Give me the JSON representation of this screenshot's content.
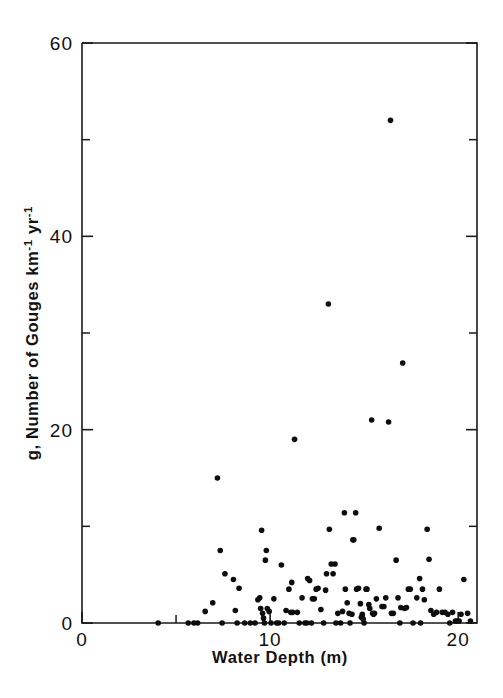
{
  "figure": {
    "background_color": "#ffffff",
    "ink_color": "#111111",
    "point_color": "#0d0d0d"
  },
  "chart_data": {
    "type": "scatter",
    "title": "",
    "xlabel": "Water Depth (m)",
    "ylabel": "g, Number of Gouges km-1 yr-1",
    "ylabel_parts": {
      "prefix": "g, Number of Gouges km",
      "sup1": "-1",
      "mid": " yr",
      "sup2": "-1"
    },
    "xlim": [
      0,
      21
    ],
    "ylim": [
      0,
      60
    ],
    "xticks": [
      0,
      10,
      20
    ],
    "xticklabels": [
      "0",
      "10",
      "20"
    ],
    "xticks_minor": [
      5,
      15
    ],
    "yticks": [
      0,
      20,
      40,
      60
    ],
    "yticklabels": [
      "0",
      "20",
      "40",
      "60"
    ],
    "yticks_minor": [
      10,
      30,
      50
    ],
    "grid": false,
    "legend": null,
    "marker": "filled-circle",
    "marker_size_px": 4,
    "n_points": 131,
    "points": [
      [
        4.05,
        0.0
      ],
      [
        5.65,
        0.0
      ],
      [
        5.95,
        0.0
      ],
      [
        6.15,
        0.0
      ],
      [
        6.55,
        1.2
      ],
      [
        6.95,
        2.1
      ],
      [
        7.2,
        15.0
      ],
      [
        7.35,
        7.5
      ],
      [
        7.45,
        0.0
      ],
      [
        7.6,
        5.1
      ],
      [
        8.05,
        4.5
      ],
      [
        8.15,
        1.3
      ],
      [
        8.25,
        0.0
      ],
      [
        8.35,
        3.6
      ],
      [
        8.65,
        0.0
      ],
      [
        8.95,
        0.0
      ],
      [
        9.2,
        0.0
      ],
      [
        9.35,
        2.4
      ],
      [
        9.45,
        2.6
      ],
      [
        9.5,
        1.5
      ],
      [
        9.55,
        9.6
      ],
      [
        9.6,
        1.0
      ],
      [
        9.65,
        0.5
      ],
      [
        9.7,
        0.0
      ],
      [
        9.75,
        6.5
      ],
      [
        9.8,
        7.5
      ],
      [
        9.85,
        1.5
      ],
      [
        9.95,
        1.2
      ],
      [
        10.05,
        0.0
      ],
      [
        10.2,
        2.5
      ],
      [
        10.35,
        0.0
      ],
      [
        10.6,
        6.0
      ],
      [
        10.75,
        0.0
      ],
      [
        10.85,
        1.3
      ],
      [
        11.0,
        3.5
      ],
      [
        11.1,
        1.1
      ],
      [
        11.15,
        4.2
      ],
      [
        11.2,
        1.1
      ],
      [
        11.3,
        19.0
      ],
      [
        11.45,
        1.1
      ],
      [
        11.55,
        0.0
      ],
      [
        11.7,
        2.6
      ],
      [
        11.85,
        0.0
      ],
      [
        12.0,
        4.6
      ],
      [
        12.1,
        4.4
      ],
      [
        12.25,
        2.5
      ],
      [
        12.35,
        2.5
      ],
      [
        12.45,
        3.5
      ],
      [
        12.55,
        3.6
      ],
      [
        12.7,
        1.4
      ],
      [
        12.85,
        0.0
      ],
      [
        12.95,
        3.4
      ],
      [
        13.0,
        5.1
      ],
      [
        13.1,
        33.0
      ],
      [
        13.15,
        9.7
      ],
      [
        13.25,
        6.1
      ],
      [
        13.35,
        5.1
      ],
      [
        13.45,
        6.1
      ],
      [
        13.6,
        1.0
      ],
      [
        13.75,
        0.0
      ],
      [
        13.85,
        1.2
      ],
      [
        13.95,
        11.4
      ],
      [
        14.0,
        3.5
      ],
      [
        14.1,
        2.1
      ],
      [
        14.2,
        1.0
      ],
      [
        14.35,
        0.9
      ],
      [
        14.4,
        8.6
      ],
      [
        14.45,
        8.6
      ],
      [
        14.55,
        11.4
      ],
      [
        14.6,
        3.5
      ],
      [
        14.7,
        3.6
      ],
      [
        14.8,
        2.0
      ],
      [
        14.85,
        0.6
      ],
      [
        14.9,
        0.9
      ],
      [
        14.95,
        0.4
      ],
      [
        15.0,
        0.0
      ],
      [
        15.1,
        3.5
      ],
      [
        15.15,
        3.5
      ],
      [
        15.25,
        1.9
      ],
      [
        15.3,
        1.5
      ],
      [
        15.4,
        21.0
      ],
      [
        15.45,
        1.0
      ],
      [
        15.5,
        0.9
      ],
      [
        15.55,
        1.0
      ],
      [
        15.65,
        2.5
      ],
      [
        15.8,
        9.8
      ],
      [
        15.95,
        1.7
      ],
      [
        16.05,
        1.7
      ],
      [
        16.15,
        2.6
      ],
      [
        16.3,
        20.8
      ],
      [
        16.4,
        52.0
      ],
      [
        16.45,
        1.0
      ],
      [
        16.55,
        1.0
      ],
      [
        16.7,
        6.5
      ],
      [
        16.8,
        2.6
      ],
      [
        16.95,
        1.6
      ],
      [
        17.05,
        26.9
      ],
      [
        17.15,
        1.5
      ],
      [
        17.25,
        1.6
      ],
      [
        17.35,
        3.5
      ],
      [
        17.45,
        3.5
      ],
      [
        17.6,
        0.0
      ],
      [
        17.8,
        2.6
      ],
      [
        17.95,
        4.6
      ],
      [
        18.1,
        3.5
      ],
      [
        18.2,
        2.4
      ],
      [
        18.35,
        9.7
      ],
      [
        18.45,
        6.6
      ],
      [
        18.55,
        1.3
      ],
      [
        18.7,
        0.9
      ],
      [
        18.85,
        1.1
      ],
      [
        19.0,
        3.5
      ],
      [
        19.15,
        1.1
      ],
      [
        19.3,
        1.1
      ],
      [
        19.45,
        0.9
      ],
      [
        19.55,
        0.0
      ],
      [
        19.7,
        1.1
      ],
      [
        19.85,
        0.2
      ],
      [
        19.95,
        0.2
      ],
      [
        20.05,
        0.2
      ],
      [
        20.15,
        0.9
      ],
      [
        20.3,
        4.5
      ],
      [
        20.5,
        1.0
      ],
      [
        20.65,
        0.2
      ],
      [
        12.2,
        0.0
      ],
      [
        13.5,
        0.0
      ],
      [
        14.25,
        0.0
      ],
      [
        16.9,
        0.0
      ],
      [
        10.45,
        0.0
      ],
      [
        11.95,
        0.0
      ],
      [
        18.0,
        0.0
      ]
    ]
  }
}
